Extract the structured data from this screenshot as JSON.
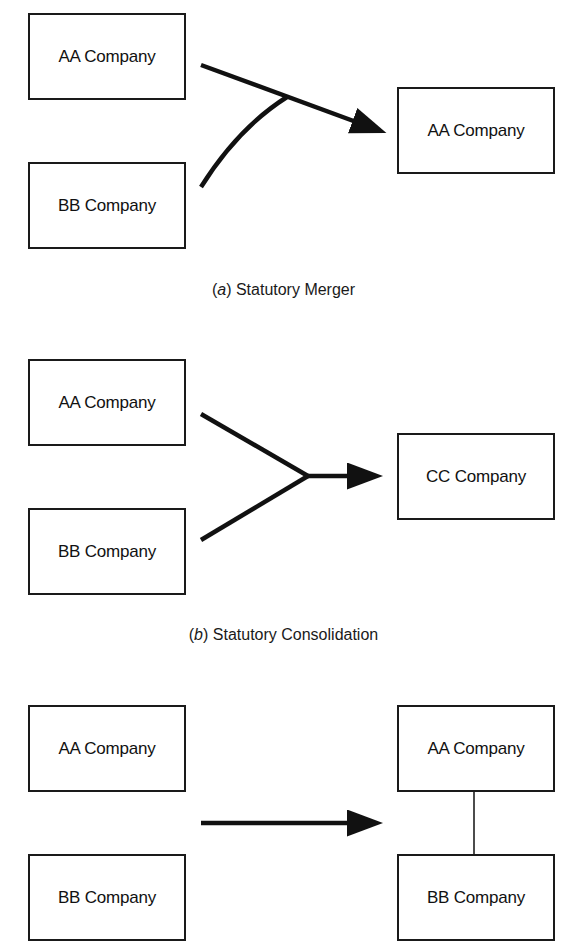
{
  "diagram": {
    "top_partial_text": "Types of Business Combinations",
    "panels": [
      {
        "id": "a",
        "caption_letter": "a",
        "caption_text": " Statutory Merger",
        "inputs": [
          "AA Company",
          "BB Company"
        ],
        "result": [
          "AA Company"
        ]
      },
      {
        "id": "b",
        "caption_letter": "b",
        "caption_text": " Statutory Consolidation",
        "inputs": [
          "AA Company",
          "BB Company"
        ],
        "result": [
          "CC Company"
        ]
      },
      {
        "id": "c",
        "inputs": [
          "AA Company",
          "BB Company"
        ],
        "result": [
          "AA Company",
          "BB Company"
        ]
      }
    ],
    "colors": {
      "line": "#111111",
      "box_border": "#1a1a1a",
      "background": "#ffffff"
    }
  }
}
